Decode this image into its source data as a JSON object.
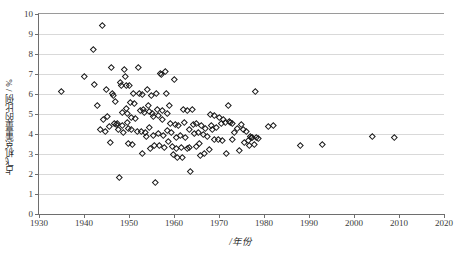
{
  "chart_data": {
    "type": "scatter",
    "title": "",
    "xlabel": "/年份",
    "ylabel": "占飞机总重量的比例 / %",
    "xlim": [
      1930,
      2020
    ],
    "ylim": [
      0,
      10
    ],
    "xticks": [
      1930,
      1940,
      1950,
      1960,
      1970,
      1980,
      1990,
      2000,
      2010,
      2020
    ],
    "yticks": [
      0,
      1,
      2,
      3,
      4,
      5,
      6,
      7,
      8,
      9,
      10
    ],
    "grid": "horizontal",
    "legend": "none",
    "marker": "open-diamond",
    "marker_color": "#1a1a1a",
    "gridline_color": "#d9d9d9",
    "axis_color": "#6e6e6e",
    "background": "#ffffff",
    "points": [
      [
        1935.0,
        6.12
      ],
      [
        1940.0,
        6.88
      ],
      [
        1942.0,
        8.25
      ],
      [
        1942.3,
        6.5
      ],
      [
        1943.0,
        5.46
      ],
      [
        1943.6,
        4.22
      ],
      [
        1944.0,
        9.45
      ],
      [
        1944.3,
        4.72
      ],
      [
        1944.8,
        4.12
      ],
      [
        1945.0,
        6.22
      ],
      [
        1945.2,
        4.9
      ],
      [
        1945.6,
        4.38
      ],
      [
        1945.9,
        3.58
      ],
      [
        1946.0,
        7.34
      ],
      [
        1946.2,
        6.02
      ],
      [
        1946.5,
        5.92
      ],
      [
        1946.8,
        4.54
      ],
      [
        1947.0,
        5.62
      ],
      [
        1947.2,
        4.48
      ],
      [
        1947.4,
        4.52
      ],
      [
        1947.6,
        4.26
      ],
      [
        1947.8,
        1.82
      ],
      [
        1948.0,
        6.58
      ],
      [
        1948.2,
        6.44
      ],
      [
        1948.4,
        5.08
      ],
      [
        1948.6,
        4.44
      ],
      [
        1948.8,
        4.08
      ],
      [
        1949.0,
        7.26
      ],
      [
        1949.1,
        6.9
      ],
      [
        1949.3,
        6.46
      ],
      [
        1949.5,
        5.28
      ],
      [
        1949.6,
        5.02
      ],
      [
        1949.7,
        4.6
      ],
      [
        1949.8,
        4.3
      ],
      [
        1949.9,
        3.56
      ],
      [
        1950.0,
        6.42
      ],
      [
        1950.2,
        5.58
      ],
      [
        1950.4,
        4.86
      ],
      [
        1950.6,
        4.22
      ],
      [
        1950.8,
        3.5
      ],
      [
        1951.0,
        6.06
      ],
      [
        1951.2,
        5.56
      ],
      [
        1951.5,
        4.78
      ],
      [
        1951.8,
        4.14
      ],
      [
        1952.0,
        7.32
      ],
      [
        1952.2,
        6.02
      ],
      [
        1952.5,
        5.18
      ],
      [
        1952.7,
        4.12
      ],
      [
        1952.9,
        3.02
      ],
      [
        1953.0,
        5.98
      ],
      [
        1953.2,
        5.26
      ],
      [
        1953.4,
        5.1
      ],
      [
        1953.6,
        4.1
      ],
      [
        1953.8,
        3.9
      ],
      [
        1954.0,
        6.24
      ],
      [
        1954.2,
        5.46
      ],
      [
        1954.4,
        5.12
      ],
      [
        1954.6,
        4.36
      ],
      [
        1954.8,
        3.28
      ],
      [
        1955.0,
        5.92
      ],
      [
        1955.2,
        5.02
      ],
      [
        1955.4,
        4.88
      ],
      [
        1955.5,
        3.92
      ],
      [
        1955.7,
        3.44
      ],
      [
        1955.9,
        1.58
      ],
      [
        1956.0,
        6.04
      ],
      [
        1956.2,
        5.22
      ],
      [
        1956.4,
        4.94
      ],
      [
        1956.6,
        4.02
      ],
      [
        1956.8,
        3.46
      ],
      [
        1957.0,
        7.06
      ],
      [
        1957.1,
        6.98
      ],
      [
        1957.3,
        5.18
      ],
      [
        1957.5,
        4.76
      ],
      [
        1957.7,
        3.96
      ],
      [
        1957.9,
        3.34
      ],
      [
        1958.0,
        7.12
      ],
      [
        1958.2,
        6.06
      ],
      [
        1958.4,
        5.04
      ],
      [
        1958.6,
        4.18
      ],
      [
        1958.8,
        3.62
      ],
      [
        1959.0,
        5.46
      ],
      [
        1959.2,
        4.52
      ],
      [
        1959.4,
        4.08
      ],
      [
        1959.6,
        3.4
      ],
      [
        1959.8,
        2.98
      ],
      [
        1960.0,
        6.74
      ],
      [
        1960.2,
        4.5
      ],
      [
        1960.4,
        3.84
      ],
      [
        1960.6,
        3.3
      ],
      [
        1960.8,
        2.86
      ],
      [
        1961.0,
        4.46
      ],
      [
        1961.3,
        3.92
      ],
      [
        1961.6,
        3.36
      ],
      [
        1961.9,
        2.84
      ],
      [
        1962.0,
        5.24
      ],
      [
        1962.3,
        4.6
      ],
      [
        1962.6,
        3.82
      ],
      [
        1962.9,
        3.3
      ],
      [
        1963.0,
        5.18
      ],
      [
        1963.3,
        4.26
      ],
      [
        1963.5,
        3.36
      ],
      [
        1963.7,
        2.12
      ],
      [
        1964.0,
        5.22
      ],
      [
        1964.3,
        4.48
      ],
      [
        1964.6,
        4.06
      ],
      [
        1964.9,
        3.38
      ],
      [
        1965.0,
        4.52
      ],
      [
        1965.3,
        4.1
      ],
      [
        1965.6,
        3.52
      ],
      [
        1965.9,
        2.96
      ],
      [
        1966.0,
        4.42
      ],
      [
        1966.4,
        4.0
      ],
      [
        1966.8,
        3.02
      ],
      [
        1967.0,
        4.28
      ],
      [
        1967.4,
        3.88
      ],
      [
        1967.8,
        3.24
      ],
      [
        1968.0,
        5.0
      ],
      [
        1968.3,
        4.46
      ],
      [
        1968.6,
        4.22
      ],
      [
        1968.9,
        3.76
      ],
      [
        1969.0,
        4.94
      ],
      [
        1969.4,
        4.32
      ],
      [
        1969.8,
        3.74
      ],
      [
        1970.0,
        4.86
      ],
      [
        1970.4,
        4.56
      ],
      [
        1970.8,
        3.7
      ],
      [
        1971.0,
        4.72
      ],
      [
        1971.4,
        4.6
      ],
      [
        1971.7,
        3.06
      ],
      [
        1972.0,
        5.46
      ],
      [
        1972.3,
        4.62
      ],
      [
        1972.6,
        4.58
      ],
      [
        1972.9,
        3.72
      ],
      [
        1973.0,
        4.56
      ],
      [
        1973.5,
        4.08
      ],
      [
        1974.0,
        4.3
      ],
      [
        1974.4,
        3.2
      ],
      [
        1975.0,
        4.5
      ],
      [
        1975.3,
        4.24
      ],
      [
        1975.6,
        3.58
      ],
      [
        1976.0,
        4.16
      ],
      [
        1976.4,
        3.68
      ],
      [
        1976.8,
        3.46
      ],
      [
        1977.0,
        3.88
      ],
      [
        1977.2,
        3.86
      ],
      [
        1977.5,
        3.84
      ],
      [
        1977.8,
        3.5
      ],
      [
        1978.0,
        6.16
      ],
      [
        1978.3,
        3.86
      ],
      [
        1978.7,
        3.78
      ],
      [
        1981.0,
        4.4
      ],
      [
        1982.0,
        4.42
      ],
      [
        1988.0,
        3.44
      ],
      [
        1993.0,
        3.5
      ],
      [
        2004.0,
        3.9
      ],
      [
        2009.0,
        3.86
      ]
    ]
  },
  "axis": {
    "y_tick_labels": [
      "0",
      "1",
      "2",
      "3",
      "4",
      "5",
      "6",
      "7",
      "8",
      "9",
      "10"
    ],
    "x_tick_labels": [
      "1930",
      "1940",
      "1950",
      "1960",
      "1970",
      "1980",
      "1990",
      "2000",
      "2010",
      "2020"
    ]
  }
}
